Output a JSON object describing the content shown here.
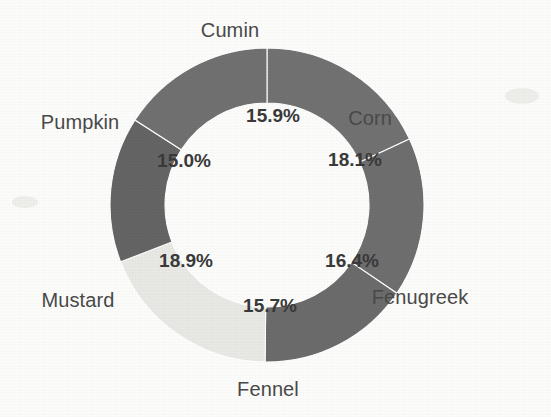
{
  "chart_data": {
    "type": "pie",
    "variant": "donut",
    "title": "",
    "subtitle": "",
    "xlabel": "",
    "ylabel": "",
    "legend": "none",
    "grid": false,
    "value_unit": "%",
    "start_angle_deg": 0,
    "direction": "clockwise",
    "center": {
      "x": 267,
      "y": 205
    },
    "outer_radius": 157,
    "inner_radius": 102,
    "categories": [
      "Corn",
      "Fenugreek",
      "Fennel",
      "Mustard",
      "Pumpkin",
      "Cumin"
    ],
    "values": [
      18.1,
      16.4,
      15.7,
      18.9,
      15.0,
      15.9
    ],
    "total": 100.0,
    "slices": [
      {
        "label": "Corn",
        "value": 18.1,
        "percent_text": "18.1%",
        "color": "#727272",
        "start_deg": 0.0,
        "end_deg": 65.16,
        "label_pos": {
          "x": 370,
          "y": 118
        },
        "pct_pos": {
          "x": 355,
          "y": 161
        }
      },
      {
        "label": "Fenugreek",
        "value": 16.4,
        "percent_text": "16.4%",
        "color": "#6f6f6f",
        "start_deg": 65.16,
        "end_deg": 124.2,
        "label_pos": {
          "x": 420,
          "y": 297
        },
        "pct_pos": {
          "x": 352,
          "y": 262
        }
      },
      {
        "label": "Fennel",
        "value": 15.7,
        "percent_text": "15.7%",
        "color": "#6c6c6c",
        "start_deg": 124.2,
        "end_deg": 180.72,
        "label_pos": {
          "x": 268,
          "y": 389
        },
        "pct_pos": {
          "x": 270,
          "y": 307
        }
      },
      {
        "label": "Mustard",
        "value": 18.9,
        "percent_text": "18.9%",
        "color": "#e9e9e6",
        "start_deg": 180.72,
        "end_deg": 248.76,
        "label_pos": {
          "x": 78,
          "y": 300
        },
        "pct_pos": {
          "x": 186,
          "y": 262
        }
      },
      {
        "label": "Pumpkin",
        "value": 15.0,
        "percent_text": "15.0%",
        "color": "#656565",
        "start_deg": 248.76,
        "end_deg": 302.76,
        "label_pos": {
          "x": 80,
          "y": 122
        },
        "pct_pos": {
          "x": 184,
          "y": 162
        }
      },
      {
        "label": "Cumin",
        "value": 15.9,
        "percent_text": "15.9%",
        "color": "#717171",
        "start_deg": 302.76,
        "end_deg": 360.0,
        "label_pos": {
          "x": 230,
          "y": 30
        },
        "pct_pos": {
          "x": 273,
          "y": 117
        }
      }
    ],
    "colors": {
      "background": "#fdfdfc",
      "slice_dark": "#717171",
      "slice_light": "#e9e9e6",
      "label_text": "#4a4a4a",
      "percent_text": "#3a3a3a",
      "slice_border": "#ffffff"
    }
  }
}
